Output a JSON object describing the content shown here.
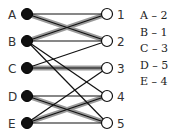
{
  "left_nodes": [
    {
      "id": "A",
      "x": 27,
      "y": 14
    },
    {
      "id": "B",
      "x": 27,
      "y": 41
    },
    {
      "id": "C",
      "x": 27,
      "y": 68
    },
    {
      "id": "D",
      "x": 27,
      "y": 96
    },
    {
      "id": "E",
      "x": 27,
      "y": 123
    }
  ],
  "right_nodes": [
    {
      "id": "1",
      "x": 107,
      "y": 14
    },
    {
      "id": "2",
      "x": 107,
      "y": 41
    },
    {
      "id": "3",
      "x": 107,
      "y": 68
    },
    {
      "id": "4",
      "x": 107,
      "y": 96
    },
    {
      "id": "5",
      "x": 107,
      "y": 123
    }
  ],
  "edges": [
    [
      "A",
      "1"
    ],
    [
      "A",
      "2"
    ],
    [
      "B",
      "1"
    ],
    [
      "B",
      "2"
    ],
    [
      "B",
      "4"
    ],
    [
      "B",
      "5"
    ],
    [
      "C",
      "2"
    ],
    [
      "C",
      "3"
    ],
    [
      "D",
      "4"
    ],
    [
      "D",
      "5"
    ],
    [
      "E",
      "3"
    ],
    [
      "E",
      "4"
    ],
    [
      "E",
      "5"
    ]
  ],
  "matching_edges": [
    [
      "A",
      "2"
    ],
    [
      "B",
      "1"
    ],
    [
      "C",
      "3"
    ],
    [
      "D",
      "5"
    ],
    [
      "E",
      "4"
    ]
  ],
  "matching_list": [
    "A – 2",
    "B – 1",
    "C – 3",
    "D – 5",
    "E – 4"
  ],
  "colors": {
    "edge": "#111111",
    "highlight": "#9a9a9a",
    "left_fill": "#111111",
    "right_fill": "#ffffff"
  }
}
